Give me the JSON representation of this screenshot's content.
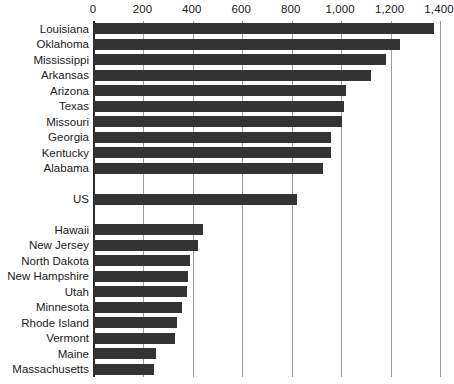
{
  "chart_data": {
    "type": "bar",
    "orientation": "horizontal",
    "title": "",
    "subtitle": "",
    "xlabel": "",
    "ylabel": "",
    "xlim": [
      0,
      1400
    ],
    "ylim": null,
    "grid": true,
    "grid_axis": "x",
    "legend": false,
    "legend_position": "none",
    "axis_position": "top",
    "bar_color": "#333333",
    "gridline_color": "#9d9d9d",
    "background_color": "#ffffff",
    "xticks": [
      0,
      200,
      400,
      600,
      800,
      1000,
      1200,
      1400
    ],
    "xtick_labels": [
      "0",
      "200",
      "400",
      "600",
      "800",
      "1,000",
      "1,200",
      "1,400"
    ],
    "categories": [
      "Louisiana",
      "Oklahoma",
      "Mississippi",
      "Arkansas",
      "Arizona",
      "Texas",
      "Missouri",
      "Georgia",
      "Kentucky",
      "Alabama",
      "US",
      "Hawaii",
      "New Jersey",
      "North Dakota",
      "New Hampshire",
      "Utah",
      "Minnesota",
      "Rhode Island",
      "Vermont",
      "Maine",
      "Massachusetts"
    ],
    "values": [
      1375,
      1240,
      1180,
      1120,
      1020,
      1010,
      1005,
      960,
      958,
      925,
      820,
      440,
      420,
      387,
      382,
      375,
      355,
      335,
      327,
      250,
      242
    ],
    "rows": [
      {
        "label": "Louisiana",
        "value": 1375,
        "row": 0
      },
      {
        "label": "Oklahoma",
        "value": 1240,
        "row": 1
      },
      {
        "label": "Mississippi",
        "value": 1180,
        "row": 2
      },
      {
        "label": "Arkansas",
        "value": 1120,
        "row": 3
      },
      {
        "label": "Arizona",
        "value": 1020,
        "row": 4
      },
      {
        "label": "Texas",
        "value": 1010,
        "row": 5
      },
      {
        "label": "Missouri",
        "value": 1005,
        "row": 6
      },
      {
        "label": "Georgia",
        "value": 960,
        "row": 7
      },
      {
        "label": "Kentucky",
        "value": 958,
        "row": 8
      },
      {
        "label": "Alabama",
        "value": 925,
        "row": 9
      },
      {
        "label": "US",
        "value": 820,
        "row": 11
      },
      {
        "label": "Hawaii",
        "value": 440,
        "row": 13
      },
      {
        "label": "New Jersey",
        "value": 420,
        "row": 14
      },
      {
        "label": "North Dakota",
        "value": 387,
        "row": 15
      },
      {
        "label": "New Hampshire",
        "value": 382,
        "row": 16
      },
      {
        "label": "Utah",
        "value": 375,
        "row": 17
      },
      {
        "label": "Minnesota",
        "value": 355,
        "row": 18
      },
      {
        "label": "Rhode Island",
        "value": 335,
        "row": 19
      },
      {
        "label": "Vermont",
        "value": 327,
        "row": 20
      },
      {
        "label": "Maine",
        "value": 250,
        "row": 21
      },
      {
        "label": "Massachusetts",
        "value": 242,
        "row": 22
      }
    ],
    "total_row_slots": 23,
    "annotations": []
  }
}
